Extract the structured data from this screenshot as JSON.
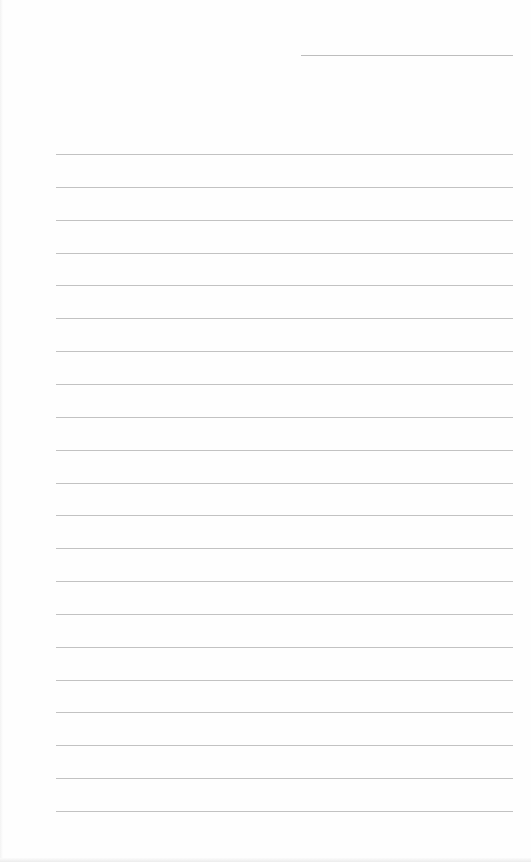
{
  "page": {
    "type": "lined-notepaper",
    "background_color": "#fefefe",
    "line_color": "#c2c2c2"
  },
  "header_rule": {
    "x_start": 301,
    "x_end": 513,
    "y": 55
  },
  "ruled_lines": {
    "count": 21,
    "x_start": 56,
    "x_end": 513,
    "first_y": 154,
    "spacing": 32.85
  }
}
